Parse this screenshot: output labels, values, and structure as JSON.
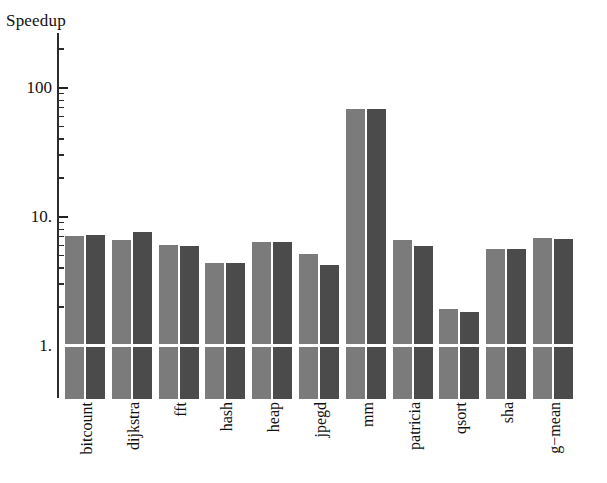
{
  "chart_data": {
    "type": "bar",
    "title": "",
    "ylabel": "Speedup",
    "xlabel": "",
    "yscale": "log",
    "ylim": [
      1,
      200
    ],
    "grid": false,
    "legend": "none",
    "axis_title": "Speedup",
    "y_ticks_major": [
      {
        "value": 1,
        "label": "1."
      },
      {
        "value": 10,
        "label": "10."
      },
      {
        "value": 100,
        "label": "100"
      }
    ],
    "y_ticks_minor": [
      2,
      3,
      4,
      5,
      6,
      7,
      8,
      9,
      20,
      30,
      40,
      50,
      60,
      70,
      80,
      90,
      200
    ],
    "categories": [
      "bitcount",
      "dijkstra",
      "fft",
      "hash",
      "heap",
      "jpegd",
      "mm",
      "patricia",
      "qsort",
      "sha",
      "g−mean"
    ],
    "series": [
      {
        "name": "series-1",
        "color": "#7b7b7b",
        "values": [
          7.0,
          6.5,
          6.0,
          4.3,
          6.3,
          5.1,
          68.0,
          6.5,
          1.9,
          5.5,
          6.7
        ]
      },
      {
        "name": "series-2",
        "color": "#4b4b4b",
        "values": [
          7.1,
          7.5,
          5.9,
          4.3,
          6.3,
          4.2,
          68.0,
          5.9,
          1.8,
          5.5,
          6.6
        ]
      }
    ],
    "unity_line": {
      "value": 1,
      "color": "#ffffff"
    }
  },
  "colors": {
    "axis": "#2c2c2c",
    "background": "#ffffff",
    "text": "#111111",
    "series_1": "#7b7b7b",
    "series_2": "#4b4b4b",
    "unity_line": "#ffffff"
  }
}
